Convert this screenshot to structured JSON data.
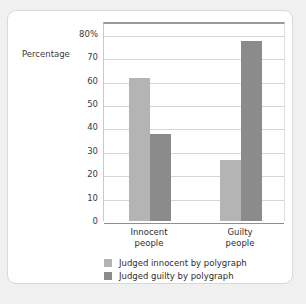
{
  "chart_data": {
    "type": "bar",
    "title": "",
    "xlabel": "",
    "ylabel": "Percentage",
    "categories": [
      "Innocent people",
      "Guilty people"
    ],
    "category_lines": [
      [
        "Innocent",
        "people"
      ],
      [
        "Guilty",
        "people"
      ]
    ],
    "series": [
      {
        "name": "Judged innocent by polygraph",
        "color": "#b4b4b4",
        "values": [
          61,
          26
        ]
      },
      {
        "name": "Judged guilty by polygraph",
        "color": "#8b8b8b",
        "values": [
          37,
          77
        ]
      }
    ],
    "ylim": [
      0,
      85
    ],
    "yticks": [
      0,
      10,
      20,
      30,
      40,
      50,
      60,
      70,
      80
    ],
    "ytick_labels": [
      "0",
      "10",
      "20",
      "30",
      "40",
      "50",
      "60",
      "70",
      "80%"
    ],
    "grid": true,
    "legend_position": "bottom"
  },
  "colors": {
    "card_background": "#ffffff",
    "page_background": "#f0f0f0",
    "card_border": "#d8d8d8",
    "gridline": "#d5d5d5",
    "axis": "#8f8f8f",
    "text": "#2e2e2e"
  }
}
